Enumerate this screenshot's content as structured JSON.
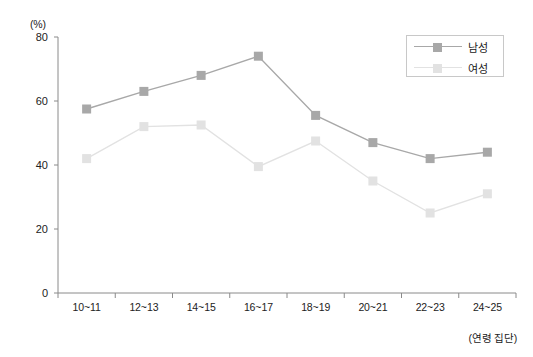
{
  "chart_data": {
    "type": "line",
    "title": "",
    "xlabel": "(연령 집단)",
    "ylabel": "(%)",
    "categories": [
      "10~11",
      "12~13",
      "14~15",
      "16~17",
      "18~19",
      "20~21",
      "22~23",
      "24~25"
    ],
    "series": [
      {
        "name": "남성",
        "color": "#a8a8a8",
        "values": [
          57.5,
          63,
          68,
          74,
          55.5,
          47,
          42,
          44
        ]
      },
      {
        "name": "여성",
        "color": "#e2e2e2",
        "values": [
          42,
          52,
          52.5,
          39.5,
          47.5,
          35,
          25,
          31
        ]
      }
    ],
    "y_ticks": [
      0,
      20,
      40,
      60,
      80
    ],
    "ylim": [
      0,
      80
    ],
    "grid": false,
    "legend_position": "top-right",
    "marker": "square"
  },
  "legend": {
    "items": [
      {
        "label": "남성"
      },
      {
        "label": "여성"
      }
    ]
  },
  "axes": {
    "y_unit": "(%)",
    "x_unit": "(연령 집단)"
  }
}
